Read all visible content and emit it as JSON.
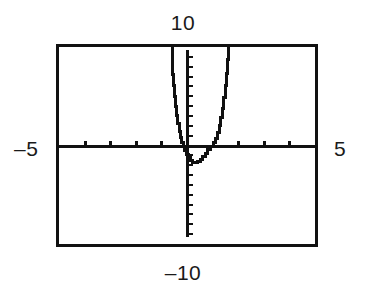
{
  "screen": {
    "type": "graphing-calculator-plot",
    "background_color": "#ffffff",
    "line_color": "#111111",
    "frame_color": "#111111"
  },
  "labels": {
    "top": "10",
    "bottom": "–10",
    "left": "–5",
    "right": "5"
  },
  "chart_data": {
    "type": "line",
    "title": "",
    "subtitle": "",
    "xlabel": "",
    "ylabel": "",
    "xlim": [
      -5,
      5
    ],
    "ylim": [
      -10,
      10
    ],
    "grid": false,
    "legend": null,
    "axis_style": "calculator-ticks",
    "x_tick_step": 1,
    "y_tick_step": 1,
    "x_tick_values": [
      -5,
      -4,
      -3,
      -2,
      -1,
      0,
      1,
      2,
      3,
      4,
      5
    ],
    "y_tick_values": [
      -10,
      -9,
      -8,
      -7,
      -6,
      -5,
      -4,
      -3,
      -2,
      -1,
      0,
      1,
      2,
      3,
      4,
      5,
      6,
      7,
      8,
      9,
      10
    ],
    "window_labels": {
      "xmin": "–5",
      "xmax": "5",
      "ymin": "–10",
      "ymax": "10"
    },
    "annotations": [
      "steep U-shaped curve, vertex below x-axis near x = 0.3",
      "left branch exits top of window near x = -0.6",
      "right branch exits top of window near x = 1.5"
    ],
    "series": [
      {
        "name": "curve",
        "points": [
          [
            -0.62,
            10.0
          ],
          [
            -0.6,
            8.6
          ],
          [
            -0.57,
            7.3
          ],
          [
            -0.54,
            6.1
          ],
          [
            -0.5,
            5.0
          ],
          [
            -0.46,
            4.0
          ],
          [
            -0.42,
            3.1
          ],
          [
            -0.38,
            2.3
          ],
          [
            -0.33,
            1.5
          ],
          [
            -0.28,
            0.9
          ],
          [
            -0.22,
            0.35
          ],
          [
            -0.16,
            0.0
          ],
          [
            -0.1,
            -0.45
          ],
          [
            -0.04,
            -0.85
          ],
          [
            0.04,
            -1.2
          ],
          [
            0.12,
            -1.5
          ],
          [
            0.2,
            -1.65
          ],
          [
            0.3,
            -1.7
          ],
          [
            0.4,
            -1.6
          ],
          [
            0.5,
            -1.4
          ],
          [
            0.6,
            -1.1
          ],
          [
            0.7,
            -0.75
          ],
          [
            0.8,
            -0.4
          ],
          [
            0.9,
            0.0
          ],
          [
            1.0,
            0.35
          ],
          [
            1.08,
            0.8
          ],
          [
            1.16,
            1.4
          ],
          [
            1.24,
            2.1
          ],
          [
            1.3,
            2.9
          ],
          [
            1.36,
            3.8
          ],
          [
            1.42,
            4.9
          ],
          [
            1.47,
            6.1
          ],
          [
            1.52,
            7.4
          ],
          [
            1.56,
            8.8
          ],
          [
            1.6,
            10.0
          ]
        ]
      }
    ]
  }
}
